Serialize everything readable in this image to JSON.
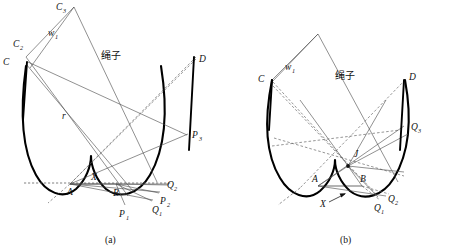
{
  "figure": {
    "background_color": "#ffffff",
    "stroke_color": "#000000",
    "thin_stroke_color": "#4d4d4d",
    "dash_stroke_color": "#555555"
  },
  "panel_a": {
    "caption": "(a)",
    "rope_label": "绳子",
    "labels": {
      "c3": "C",
      "c3_sub": "3",
      "c2": "C",
      "c2_sub": "2",
      "c": "C",
      "d": "D",
      "w1": "w",
      "w1_sub": "1",
      "r": "r",
      "a": "A",
      "b": "B",
      "x": "X",
      "p1": "P",
      "p1_sub": "1",
      "p2": "P",
      "p2_sub": "2",
      "p3": "P",
      "p3_sub": "3",
      "q1": "Q",
      "q1_sub": "1",
      "q2": "Q",
      "q2_sub": "2"
    }
  },
  "panel_b": {
    "caption": "(b)",
    "rope_label": "绳子",
    "labels": {
      "c": "C",
      "d": "D",
      "w1": "w",
      "w1_sub": "1",
      "a": "A",
      "b": "B",
      "x": "X",
      "j": "J",
      "q1": "Q",
      "q1_sub": "1",
      "q2": "Q",
      "q2_sub": "2",
      "q3": "Q",
      "q3_sub": "3"
    }
  }
}
